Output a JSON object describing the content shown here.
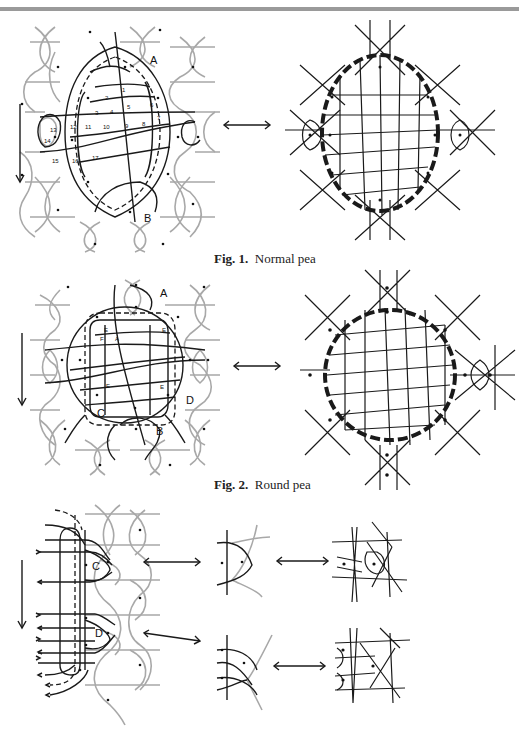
{
  "figures": [
    {
      "id": "fig1",
      "caption_number": "Fig. 1.",
      "caption_text": "Normal pea",
      "labels": [
        "A",
        "B"
      ],
      "pin_numbers": [
        "1",
        "2",
        "3",
        "4",
        "5",
        "6",
        "7",
        "8",
        "9",
        "10",
        "11",
        "12",
        "13",
        "14",
        "15",
        "16",
        "17"
      ],
      "arrow": "double-headed horizontal",
      "direction_arrow": "down"
    },
    {
      "id": "fig2",
      "caption_number": "Fig. 2.",
      "caption_text": "Round pea",
      "labels": [
        "A",
        "B",
        "C",
        "D"
      ],
      "inner_labels": [
        "E",
        "E",
        "E",
        "E",
        "F",
        "A"
      ],
      "arrow": "double-headed horizontal",
      "direction_arrow": "down"
    },
    {
      "id": "fig3",
      "caption_number": "",
      "caption_text": "",
      "labels": [
        "C",
        "D"
      ],
      "arrows": [
        "double-headed horizontal",
        "double-headed horizontal",
        "double-headed horizontal",
        "double-headed horizontal"
      ],
      "direction_arrow": "down"
    }
  ],
  "colors": {
    "ground_thread": "#a8a8a8",
    "working_thread": "#1a1a1a",
    "top_rule": "#9a9a9a"
  }
}
